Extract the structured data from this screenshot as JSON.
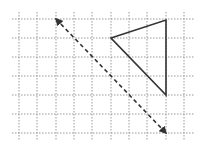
{
  "diagram": {
    "type": "grid-reflection",
    "grid": {
      "x_lines": [
        19,
        37,
        56,
        74,
        92,
        111,
        129,
        147,
        166,
        184
      ],
      "y_lines": [
        19,
        38,
        57,
        76,
        95,
        114,
        133
      ],
      "x_extent": [
        12,
        195
      ],
      "y_extent": [
        12,
        140
      ],
      "color": "#999999",
      "style": "dotted"
    },
    "triangle": {
      "points": [
        [
          111,
          38
        ],
        [
          166,
          20
        ],
        [
          166,
          95
        ]
      ],
      "stroke": "#333333",
      "stroke_width": 1.6
    },
    "mirror_line": {
      "from": [
        56,
        19
      ],
      "to": [
        166,
        133
      ],
      "stroke": "#333333",
      "style": "dashed",
      "arrowheads": "both"
    }
  }
}
